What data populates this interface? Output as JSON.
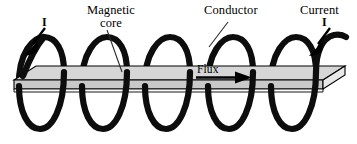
{
  "figure": {
    "background_color": "#ffffff",
    "width": 357,
    "height": 144
  },
  "labels": {
    "magnetic_core_line1": "Magnetic",
    "magnetic_core_line2": "core",
    "conductor": "Conductor",
    "current": "Current",
    "current_symbol_right": "I",
    "current_symbol_left": "I",
    "flux": "Flux"
  },
  "colors": {
    "ink": "#000000",
    "coil": "#0d0d0d",
    "core_top_face": "#d6d6d6",
    "core_front_face": "#c9c9c9",
    "core_side_face": "#e8e8e8",
    "core_bottom_strip": "#fbfbfb",
    "leader_line": "#2b2b2b"
  },
  "geometry": {
    "coil_turns": 5,
    "coil_stroke_width": 6.2,
    "coil_x_positions": [
      40,
      103,
      166,
      229,
      292
    ],
    "coil_top_y": 38,
    "coil_bottom_y": 130,
    "coil_half_width": 22,
    "slab_top_y": 66,
    "slab_front_y": 86,
    "slab_left_x": 14,
    "slab_right_x": 345
  },
  "annotations": {
    "flux_arrow_direction": "right",
    "current_arrow_left_direction": "down-left",
    "current_arrow_right_direction": "down-left",
    "leaders": [
      {
        "name": "magnetic-core-leader",
        "from": "label",
        "to": "core-top-face"
      },
      {
        "name": "conductor-leader",
        "from": "label",
        "to": "coil-winding"
      }
    ]
  }
}
